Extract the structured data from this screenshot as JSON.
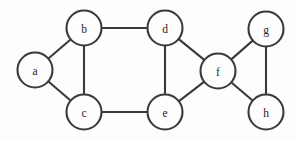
{
  "figure": {
    "width": 298,
    "height": 141,
    "background_color": "#fdfdfd",
    "node_fill_color": "#fdfdfd",
    "stroke_color": "#3a3a3a",
    "label_color": "#1d1d1d",
    "node_radius": 17.5,
    "stroke_width": 2.1
  },
  "chart_data": {
    "type": "diagram",
    "diagram_kind": "undirected-graph",
    "title": "",
    "directed": false,
    "weighted": false,
    "node_count": 8,
    "edge_count": 11,
    "nodes": [
      {
        "id": "a",
        "label": "a",
        "x": 35,
        "y": 70,
        "r": 17.5,
        "degree": 2
      },
      {
        "id": "b",
        "label": "b",
        "x": 84,
        "y": 28,
        "r": 17.5,
        "degree": 3
      },
      {
        "id": "c",
        "label": "c",
        "x": 84,
        "y": 112,
        "r": 17.5,
        "degree": 3
      },
      {
        "id": "d",
        "label": "d",
        "x": 165,
        "y": 28,
        "r": 17.5,
        "degree": 3
      },
      {
        "id": "e",
        "label": "e",
        "x": 165,
        "y": 112,
        "r": 17.5,
        "degree": 3
      },
      {
        "id": "f",
        "label": "f",
        "x": 218,
        "y": 71,
        "r": 17.5,
        "degree": 4
      },
      {
        "id": "g",
        "label": "g",
        "x": 266,
        "y": 29,
        "r": 17.5,
        "degree": 2
      },
      {
        "id": "h",
        "label": "h",
        "x": 266,
        "y": 112,
        "r": 17.5,
        "degree": 2
      }
    ],
    "edges": [
      {
        "source": "a",
        "target": "b"
      },
      {
        "source": "a",
        "target": "c"
      },
      {
        "source": "b",
        "target": "c"
      },
      {
        "source": "b",
        "target": "d"
      },
      {
        "source": "c",
        "target": "e"
      },
      {
        "source": "d",
        "target": "e"
      },
      {
        "source": "d",
        "target": "f"
      },
      {
        "source": "e",
        "target": "f"
      },
      {
        "source": "f",
        "target": "g"
      },
      {
        "source": "f",
        "target": "h"
      },
      {
        "source": "g",
        "target": "h"
      }
    ],
    "adjacency": {
      "a": [
        "b",
        "c"
      ],
      "b": [
        "a",
        "c",
        "d"
      ],
      "c": [
        "a",
        "b",
        "e"
      ],
      "d": [
        "b",
        "e",
        "f"
      ],
      "e": [
        "c",
        "d",
        "f"
      ],
      "f": [
        "d",
        "e",
        "g",
        "h"
      ],
      "g": [
        "f",
        "h"
      ],
      "h": [
        "f",
        "g"
      ]
    }
  }
}
